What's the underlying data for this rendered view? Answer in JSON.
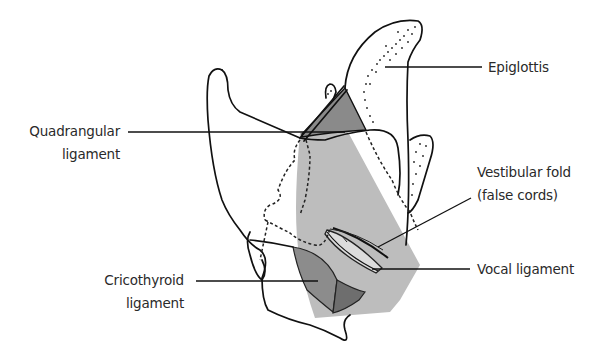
{
  "diagram": {
    "labels": {
      "epiglottis": "Epiglottis",
      "quadrangular_line1": "Quadrangular",
      "quadrangular_line2": "ligament",
      "vestibular_line1": "Vestibular fold",
      "vestibular_line2": "(false cords)",
      "vocal": "Vocal ligament",
      "cricothyroid_line1": "Cricothyroid",
      "cricothyroid_line2": "ligament"
    },
    "colors": {
      "outline": "#111111",
      "quadrangular_fill": "#8a8a8a",
      "membrane_fill": "#bdbdbd",
      "cricothyroid_fill": "#8c8c8c",
      "cricothyroid_dark_fill": "#6e6e6e",
      "background": "#ffffff"
    }
  }
}
